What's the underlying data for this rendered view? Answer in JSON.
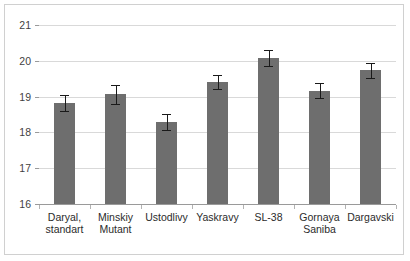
{
  "chart_data": {
    "type": "bar",
    "title": "",
    "subtitle": "",
    "xlabel": "",
    "ylabel": "",
    "ylim": [
      16,
      21
    ],
    "ytick_labels": [
      "16",
      "17",
      "18",
      "19",
      "20",
      "21"
    ],
    "ytick_values": [
      16,
      17,
      18,
      19,
      20,
      21
    ],
    "grid": true,
    "legend": false,
    "legend_position": "none",
    "bar_color": "#6e6e6e",
    "error_bar_color": "#1a1a1a",
    "gridline_color": "#d9d9d9",
    "axis_color": "#9a9a9a",
    "frame_color": "#d0d0d0",
    "background_color": "#ffffff",
    "categories": [
      "Daryal,\nstandart",
      "Minskiy\nMutant",
      "Ustodlivy",
      "Yaskravy",
      "SL-38",
      "Gornaya\nSaniba",
      "Dargavski"
    ],
    "values": [
      18.83,
      19.06,
      18.3,
      19.4,
      20.08,
      19.17,
      19.73
    ],
    "errors": [
      0.22,
      0.26,
      0.22,
      0.2,
      0.22,
      0.22,
      0.22
    ]
  }
}
